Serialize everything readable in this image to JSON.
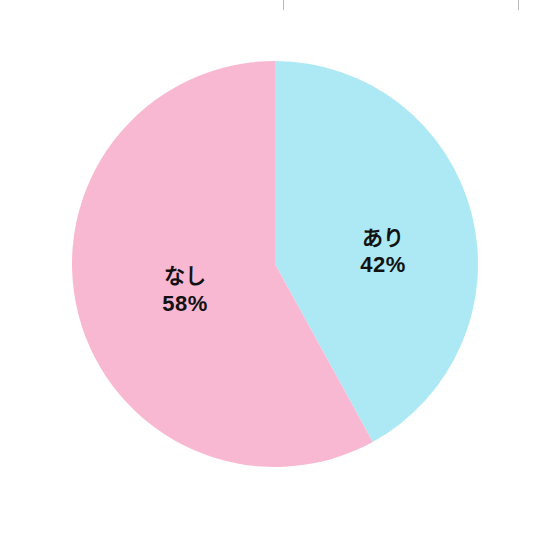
{
  "page": {
    "width": 552,
    "height": 542,
    "background_color": "#ffffff"
  },
  "top_strip": {
    "description_note": "bottom sliver of a clipped table row above the chart",
    "text_fragment_left": "・・  ・・",
    "text_fragment_right": "・・ ・ ・・",
    "rule_color": "#b9b9b9"
  },
  "chart_data": {
    "type": "pie",
    "title": "",
    "subtitle": "",
    "xlabel": "",
    "ylabel": "",
    "legend_position": "none",
    "grid": false,
    "start_angle_deg": 0,
    "direction": "clockwise",
    "units": "%",
    "categories": [
      "あり",
      "なし"
    ],
    "values": [
      42,
      58
    ],
    "labels": [
      "42%",
      "58%"
    ],
    "colors": [
      "#ace9f5",
      "#f9b8d2"
    ],
    "slices": [
      {
        "name": "あり",
        "value": 42,
        "value_label": "42%",
        "color": "#ace9f5",
        "start_angle_deg": 0,
        "end_angle_deg": 151.2,
        "label_x": 383,
        "label_name_y": 237,
        "label_value_y": 265
      },
      {
        "name": "なし",
        "value": 58,
        "value_label": "58%",
        "color": "#f9b8d2",
        "start_angle_deg": 151.2,
        "end_angle_deg": 360,
        "label_x": 185,
        "label_name_y": 275,
        "label_value_y": 304
      }
    ],
    "geometry": {
      "center_x": 275,
      "center_y": 264,
      "radius": 203
    },
    "label_color": "#121212"
  }
}
